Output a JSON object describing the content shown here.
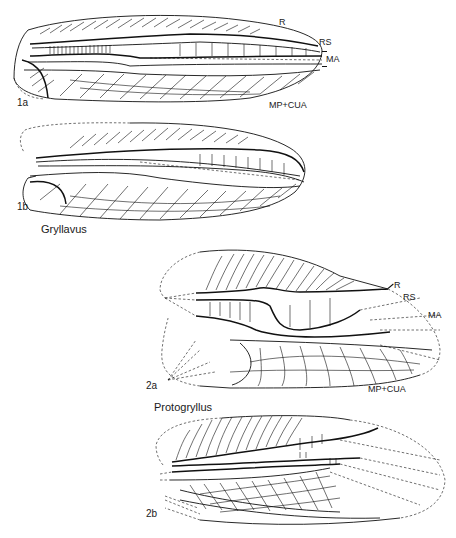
{
  "figure": {
    "panels": [
      {
        "id": "1a",
        "label": "1a",
        "vein_labels": {
          "r": "R",
          "rs": "RS",
          "ma": "MA",
          "mp_cua": "MP+CUA"
        }
      },
      {
        "id": "1b",
        "label": "1b"
      },
      {
        "id": "2a",
        "label": "2a",
        "vein_labels": {
          "r": "R",
          "rs": "RS",
          "ma": "MA",
          "mp_cua": "MP+CUA"
        }
      },
      {
        "id": "2b",
        "label": "2b"
      }
    ],
    "genera": [
      {
        "name": "Gryllavus",
        "panels": [
          "1a",
          "1b"
        ]
      },
      {
        "name": "Protogryllus",
        "panels": [
          "2a",
          "2b"
        ]
      }
    ]
  }
}
